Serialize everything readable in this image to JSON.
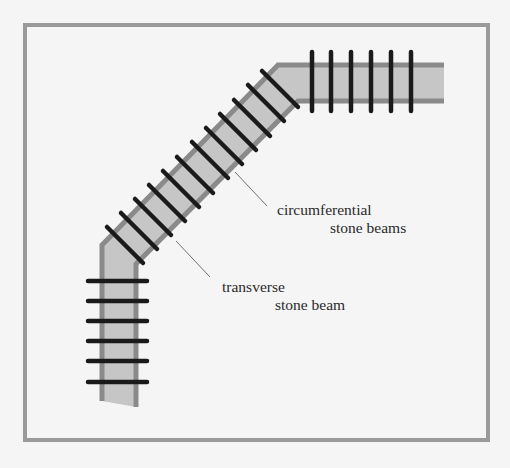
{
  "diagram": {
    "title": "",
    "colors": {
      "background": "#f5f5f5",
      "frame": "#9a9a9a",
      "beam_fill": "#c6c6c6",
      "rail": "#8a8a8a",
      "tie": "#1a1a1a",
      "leader": "#707070",
      "text": "#2a2a2a"
    },
    "labels": {
      "circumferential_line1": "circumferential",
      "circumferential_line2": "stone beams",
      "transverse_line1": "transverse",
      "transverse_line2": "stone beam"
    },
    "segments": [
      {
        "name": "vertical-lower-segment",
        "tie_count": 6,
        "tie_orientation": "horizontal"
      },
      {
        "name": "diagonal-segment",
        "tie_count": 12,
        "tie_orientation": "perpendicular-to-rails"
      },
      {
        "name": "horizontal-upper-segment",
        "tie_count": 6,
        "tie_orientation": "vertical"
      }
    ]
  }
}
